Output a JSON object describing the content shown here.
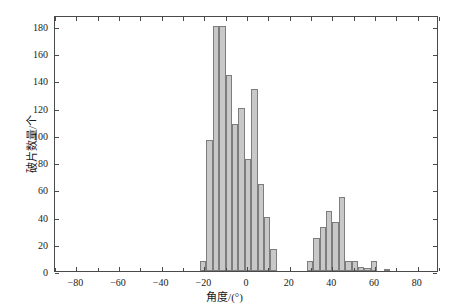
{
  "chart_data": {
    "type": "bar",
    "title": "",
    "xlabel": "角度/(°)",
    "ylabel": "破片数量/个",
    "xlim": [
      -90,
      90
    ],
    "ylim": [
      0,
      188
    ],
    "grid": false,
    "legend": null,
    "bin_width": 3,
    "bar_color": "#c8c8c8",
    "bar_edge_color": "#7d7d7d",
    "axis_color": "#4a4a4a",
    "xticks": [
      -80,
      -60,
      -40,
      -20,
      0,
      20,
      40,
      60,
      80
    ],
    "xtick_labels": [
      "-80",
      "-60",
      "-40",
      "-20",
      "0",
      "20",
      "40",
      "60",
      "80"
    ],
    "yticks": [
      0,
      20,
      40,
      60,
      80,
      100,
      120,
      140,
      160,
      180
    ],
    "ytick_labels": [
      "0",
      "20",
      "40",
      "60",
      "80",
      "100",
      "120",
      "140",
      "160",
      "180"
    ],
    "bins": [
      {
        "x0": -22,
        "x1": -19,
        "center": -20.5,
        "value": 7
      },
      {
        "x0": -19,
        "x1": -16,
        "center": -17.5,
        "value": 96
      },
      {
        "x0": -16,
        "x1": -13,
        "center": -14.5,
        "value": 180
      },
      {
        "x0": -13,
        "x1": -10,
        "center": -11.5,
        "value": 180
      },
      {
        "x0": -10,
        "x1": -7,
        "center": -8.5,
        "value": 144
      },
      {
        "x0": -7,
        "x1": -4,
        "center": -5.5,
        "value": 108
      },
      {
        "x0": -4,
        "x1": -1,
        "center": -2.5,
        "value": 120
      },
      {
        "x0": -1,
        "x1": 2,
        "center": 0.5,
        "value": 82
      },
      {
        "x0": 2,
        "x1": 5,
        "center": 3.5,
        "value": 134
      },
      {
        "x0": 5,
        "x1": 8,
        "center": 6.5,
        "value": 64
      },
      {
        "x0": 8,
        "x1": 11,
        "center": 9.5,
        "value": 40
      },
      {
        "x0": 11,
        "x1": 14,
        "center": 12.5,
        "value": 16
      },
      {
        "x0": 28,
        "x1": 31,
        "center": 29.5,
        "value": 7
      },
      {
        "x0": 31,
        "x1": 34,
        "center": 32.5,
        "value": 24
      },
      {
        "x0": 34,
        "x1": 37,
        "center": 35.5,
        "value": 32
      },
      {
        "x0": 37,
        "x1": 40,
        "center": 38.5,
        "value": 44
      },
      {
        "x0": 40,
        "x1": 43,
        "center": 41.5,
        "value": 36
      },
      {
        "x0": 43,
        "x1": 46,
        "center": 44.5,
        "value": 54
      },
      {
        "x0": 46,
        "x1": 49,
        "center": 47.5,
        "value": 7
      },
      {
        "x0": 49,
        "x1": 52,
        "center": 50.5,
        "value": 7
      },
      {
        "x0": 52,
        "x1": 55,
        "center": 53.5,
        "value": 3
      },
      {
        "x0": 55,
        "x1": 58,
        "center": 56.5,
        "value": 2
      },
      {
        "x0": 58,
        "x1": 61,
        "center": 59.5,
        "value": 7
      },
      {
        "x0": 64,
        "x1": 67,
        "center": 65.5,
        "value": 1
      }
    ]
  }
}
